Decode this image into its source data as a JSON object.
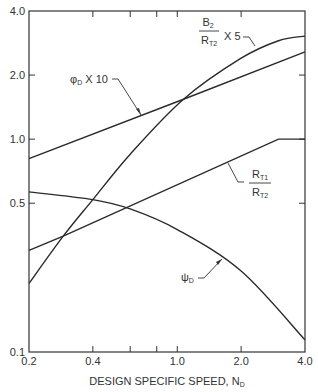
{
  "chart_data": {
    "type": "line",
    "title": "",
    "xlabel": "DESIGN SPECIFIC SPEED, N",
    "xlabel_sub": "D",
    "ylabel": "",
    "xscale": "log",
    "yscale": "log",
    "xlim": [
      0.2,
      4.0
    ],
    "ylim": [
      0.1,
      4.0
    ],
    "grid": false,
    "x_tick_labels": [
      "0.2",
      "0.4",
      "1.0",
      "2.0",
      "4.0"
    ],
    "x_ticks": [
      0.2,
      0.4,
      0.6,
      0.8,
      1.0,
      2.0,
      4.0
    ],
    "y_tick_labels": [
      "0.1",
      "0.5",
      "1.0",
      "2.0",
      "4.0"
    ],
    "y_ticks": [
      0.1,
      0.5,
      1.0,
      2.0,
      4.0
    ],
    "series": [
      {
        "name": "phi_D x 10",
        "label": "φD X 10",
        "x": [
          0.2,
          1.07,
          4.0
        ],
        "y": [
          0.81,
          1.54,
          2.57
        ]
      },
      {
        "name": "B2/RT2 x 5",
        "label": "B2/RT2 X 5",
        "x": [
          0.2,
          0.29,
          0.4,
          0.6,
          1.07,
          2.0,
          3.0,
          4.0
        ],
        "y": [
          0.21,
          0.35,
          0.52,
          0.85,
          1.54,
          2.4,
          2.9,
          3.05
        ]
      },
      {
        "name": "RT1/RT2",
        "label": "RT1/RT2",
        "x": [
          0.2,
          0.29,
          3.0,
          4.0
        ],
        "y": [
          0.3,
          0.35,
          1.0,
          1.0
        ]
      },
      {
        "name": "psi_D",
        "label": "ψD",
        "x": [
          0.2,
          0.4,
          0.6,
          1.0,
          2.0,
          4.0
        ],
        "y": [
          0.565,
          0.52,
          0.47,
          0.376,
          0.24,
          0.114
        ]
      }
    ],
    "annotations": [
      {
        "text": "φ",
        "sub": "D",
        "suffix": " X 10",
        "target": "phi_D x 10"
      },
      {
        "text": "B",
        "sub": "2",
        "denominator": "R",
        "denominator_sub": "T2",
        "suffix": "X 5",
        "target": "B2/RT2 x 5"
      },
      {
        "text": "R",
        "sub": "T1",
        "denominator": "R",
        "denominator_sub": "T2",
        "target": "RT1/RT2"
      },
      {
        "text": "ψ",
        "sub": "D",
        "target": "psi_D"
      }
    ]
  }
}
